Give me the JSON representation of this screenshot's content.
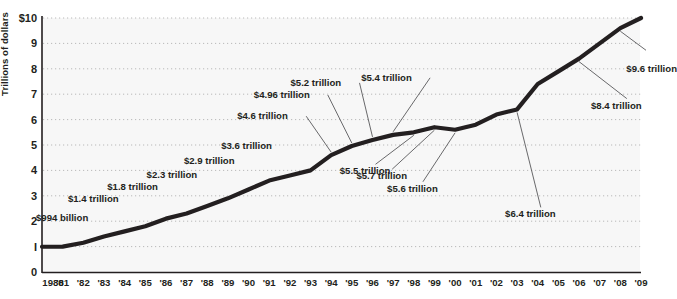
{
  "chart_data": {
    "type": "line",
    "title": "",
    "xlabel": "",
    "ylabel": "Trillions of dollars",
    "ylim": [
      0,
      10
    ],
    "xlim": [
      1980,
      2009
    ],
    "grid": "horizontal-dotted",
    "legend": "none",
    "y_ticks": [
      "0",
      "I",
      "2",
      "3",
      "4",
      "5",
      "6",
      "7",
      "8",
      "9",
      "$10"
    ],
    "y_tick_values": [
      0,
      1,
      2,
      3,
      4,
      5,
      6,
      7,
      8,
      9,
      10
    ],
    "x_tick_labels": [
      "1980",
      "'81",
      "'82",
      "'83",
      "'84",
      "'85",
      "'86",
      "'87",
      "'88",
      "'89",
      "'90",
      "'91",
      "'92",
      "'93",
      "'94",
      "'95",
      "'96",
      "'97",
      "'98",
      "'99",
      "'00",
      "'01",
      "'02",
      "'03",
      "'04",
      "'05",
      "'06",
      "'07",
      "'08",
      "'09"
    ],
    "x": [
      1980,
      1981,
      1982,
      1983,
      1984,
      1985,
      1986,
      1987,
      1988,
      1989,
      1990,
      1991,
      1992,
      1993,
      1994,
      1995,
      1996,
      1997,
      1998,
      1999,
      2000,
      2001,
      2002,
      2003,
      2004,
      2005,
      2006,
      2007,
      2008,
      2009
    ],
    "values": [
      0.994,
      1.0,
      1.15,
      1.4,
      1.6,
      1.8,
      2.1,
      2.3,
      2.6,
      2.9,
      3.25,
      3.6,
      3.8,
      4.0,
      4.6,
      4.96,
      5.2,
      5.4,
      5.5,
      5.7,
      5.6,
      5.8,
      6.2,
      6.4,
      7.4,
      7.9,
      8.4,
      9.0,
      9.6,
      10.0
    ],
    "series_color": "#231f20",
    "plot_bg": "#f7f7f7",
    "annotations": [
      {
        "label": "$994 billion",
        "year": 1980,
        "value": 0.994
      },
      {
        "label": "$1.4 trillion",
        "year": 1983,
        "value": 1.4
      },
      {
        "label": "$1.8 trillion",
        "year": 1985,
        "value": 1.8
      },
      {
        "label": "$2.3 trillion",
        "year": 1987,
        "value": 2.3
      },
      {
        "label": "$2.9 trillion",
        "year": 1989,
        "value": 2.9
      },
      {
        "label": "$3.6 trillion",
        "year": 1991,
        "value": 3.6
      },
      {
        "label": "$4.6 trillion",
        "year": 1994,
        "value": 4.6
      },
      {
        "label": "$4.96 trillion",
        "year": 1995,
        "value": 4.96
      },
      {
        "label": "$5.2 trillion",
        "year": 1996,
        "value": 5.2
      },
      {
        "label": "$5.4 trillion",
        "year": 1997,
        "value": 5.4
      },
      {
        "label": "$5.5 trillion",
        "year": 1998,
        "value": 5.5
      },
      {
        "label": "$5.7 trillion",
        "year": 1999,
        "value": 5.7
      },
      {
        "label": "$5.6 trillion",
        "year": 2000,
        "value": 5.6
      },
      {
        "label": "$6.4 trillion",
        "year": 2003,
        "value": 6.4
      },
      {
        "label": "$8.4 trillion",
        "year": 2006,
        "value": 8.4
      },
      {
        "label": "$9.6 trillion",
        "year": 2008,
        "value": 9.6
      }
    ]
  },
  "axis": {
    "y_title": "Trillions of dollars"
  }
}
